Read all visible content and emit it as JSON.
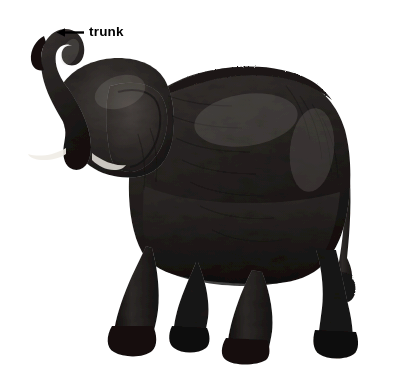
{
  "figure": {
    "background_color": "#ffffff",
    "top_band_color": "#ededed",
    "width": 397,
    "height": 370
  },
  "annotations": [
    {
      "id": "trunk",
      "label": "trunk",
      "arrow_icon": "arrow-left-icon",
      "arrow_direction": "left",
      "color": "#000000",
      "points_to": "trunk"
    }
  ],
  "subject": {
    "name": "elephant-photo",
    "alt": "elephant",
    "body_color": "#2a2726",
    "shadow_color": "#15120f",
    "highlight_color": "#6a6360",
    "parts": [
      "trunk",
      "head",
      "ear",
      "tusk",
      "back",
      "body",
      "front-leg",
      "hind-leg",
      "foot",
      "tail"
    ]
  }
}
